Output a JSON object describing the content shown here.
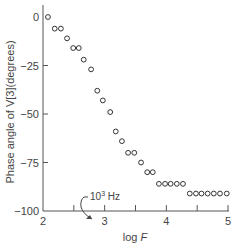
{
  "chart_data": {
    "type": "scatter",
    "title": "",
    "xlabel": "log F",
    "ylabel": "Phase angle of V[3](degrees)",
    "xlim": [
      2,
      5
    ],
    "ylim": [
      -100,
      5
    ],
    "x_ticks": [
      2,
      2.5,
      3,
      3.5,
      4,
      4.5,
      5
    ],
    "x_tick_labels": [
      "2",
      "",
      "3",
      "",
      "4",
      "",
      "5"
    ],
    "y_ticks": [
      0,
      -25,
      -50,
      -75,
      -100
    ],
    "y_tick_labels": [
      "0",
      "−25",
      "−50",
      "−75",
      "−100"
    ],
    "grid": false,
    "legend": null,
    "marker": "open-circle",
    "annotations": [
      {
        "text": "10³ Hz",
        "points_to": {
          "x": 3,
          "y": -100
        }
      }
    ],
    "series": [
      {
        "name": "Phase angle",
        "x": [
          2.08,
          2.19,
          2.29,
          2.39,
          2.49,
          2.58,
          2.66,
          2.78,
          2.88,
          2.97,
          3.09,
          3.18,
          3.28,
          3.38,
          3.48,
          3.59,
          3.69,
          3.78,
          3.88,
          3.98,
          4.07,
          4.17,
          4.27,
          4.38,
          4.48,
          4.57,
          4.67,
          4.77,
          4.87,
          4.98
        ],
        "y": [
          0,
          -6,
          -6,
          -11,
          -16,
          -16,
          -22,
          -27,
          -38,
          -43,
          -49,
          -59,
          -64,
          -70,
          -70,
          -75,
          -80,
          -80,
          -86,
          -86,
          -86,
          -86,
          -86,
          -91,
          -91,
          -91,
          -91,
          -91,
          -91,
          -91
        ]
      }
    ]
  },
  "labels": {
    "xlabel_main": "log ",
    "xlabel_var": "F",
    "ylabel": "Phase angle of V[3](degrees)",
    "annotation_base": "10",
    "annotation_exp": "3",
    "annotation_unit": " Hz"
  }
}
